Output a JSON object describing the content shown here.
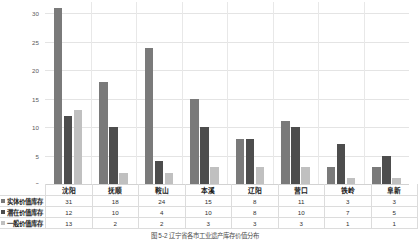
{
  "chart_data": {
    "type": "bar",
    "title": "",
    "xlabel": "",
    "ylabel": "",
    "ylim": [
      0,
      32
    ],
    "yticks": [
      "0",
      "5",
      "10",
      "15",
      "20",
      "25",
      "30"
    ],
    "grid": true,
    "legend_position": "row-headers-in-data-table",
    "categories": [
      "沈阳",
      "抚顺",
      "鞍山",
      "本溪",
      "辽阳",
      "营口",
      "铁岭",
      "阜新"
    ],
    "series": [
      {
        "name": "实体价值库存",
        "color": "#7a7a7a",
        "values": [
          31,
          18,
          24,
          15,
          8,
          11,
          3,
          3
        ]
      },
      {
        "name": "潜在价值库存",
        "color": "#4d4d4d",
        "values": [
          12,
          10,
          4,
          10,
          8,
          10,
          7,
          5
        ]
      },
      {
        "name": "一般价值库存",
        "color": "#c0c0c0",
        "values": [
          13,
          2,
          2,
          3,
          3,
          3,
          1,
          1
        ]
      }
    ]
  },
  "caption": "图 5-2  辽宁省各市工业遗产库存价值分布"
}
